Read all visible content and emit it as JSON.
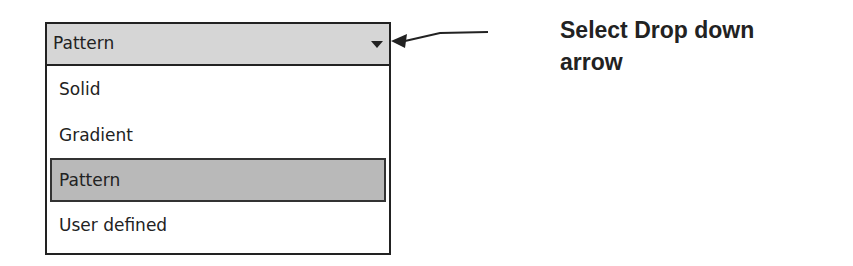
{
  "dropdown": {
    "selected_value": "Pattern",
    "arrow_icon": "chevron-down-icon",
    "options": [
      {
        "label": "Solid",
        "selected": false
      },
      {
        "label": "Gradient",
        "selected": false
      },
      {
        "label": "Pattern",
        "selected": true
      },
      {
        "label": "User defined",
        "selected": false
      }
    ]
  },
  "callout": {
    "text": "Select Drop down arrow",
    "line1": "Select Drop down",
    "line2": "arrow"
  },
  "colors": {
    "header_bg": "#d6d6d6",
    "selected_bg": "#b9b9b9",
    "border": "#222222",
    "text": "#222222"
  }
}
